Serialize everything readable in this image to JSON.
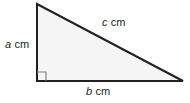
{
  "figure": {
    "kind": "right-triangle-diagram",
    "background_color": "#ffffff",
    "fill_color": "#f5f5f5",
    "stroke_color": "#231f20",
    "marker_color": "#808080",
    "geometry": {
      "apex": [
        37,
        4
      ],
      "right_angle_vertex": [
        37,
        81
      ],
      "base_right_vertex": [
        183,
        81
      ],
      "right_angle_marker_size": 9
    },
    "labels": {
      "vertical_leg": {
        "variable": "a",
        "unit": "cm"
      },
      "hypotenuse": {
        "variable": "c",
        "unit": "cm"
      },
      "base_leg": {
        "variable": "b",
        "unit": "cm"
      }
    }
  }
}
